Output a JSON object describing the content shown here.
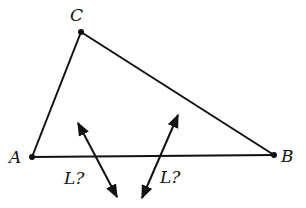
{
  "diagram": {
    "type": "geometry-triangle",
    "vertices": {
      "A": {
        "label": "A",
        "x": 32,
        "y": 157
      },
      "B": {
        "label": "B",
        "x": 274,
        "y": 155
      },
      "C": {
        "label": "C",
        "x": 81,
        "y": 32
      }
    },
    "candidate_lines": [
      {
        "label": "L?",
        "x1": 78,
        "y1": 123,
        "x2": 117,
        "y2": 197
      },
      {
        "label": "L?",
        "x1": 178,
        "y1": 115,
        "x2": 142,
        "y2": 198
      }
    ],
    "colors": {
      "stroke": "#111111",
      "background": "#ffffff"
    }
  }
}
